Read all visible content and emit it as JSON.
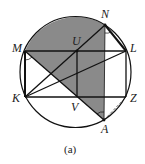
{
  "figure": {
    "caption": "(a)",
    "colors": {
      "shade": "#8a8a8a",
      "line": "#111111",
      "background": "#ffffff"
    },
    "points": {
      "M": {
        "label": "M"
      },
      "U": {
        "label": "U"
      },
      "N": {
        "label": "N"
      },
      "L": {
        "label": "L"
      },
      "K": {
        "label": "K"
      },
      "V": {
        "label": "V"
      },
      "Z": {
        "label": "Z"
      },
      "A": {
        "label": "A"
      }
    }
  }
}
